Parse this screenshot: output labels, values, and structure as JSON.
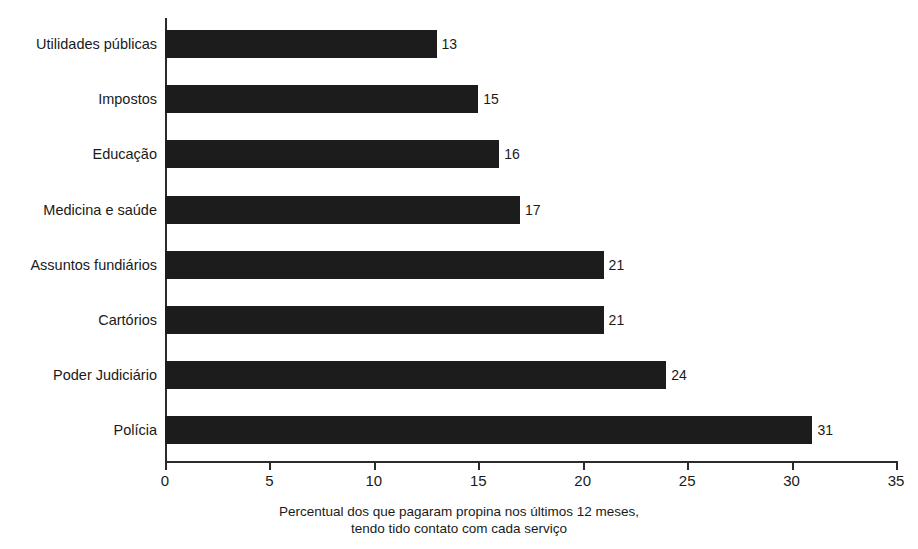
{
  "chart_data": {
    "type": "bar",
    "orientation": "horizontal",
    "title": "",
    "subtitle": "",
    "xlabel": "Percentual dos que pagaram propina nos últimos 12 meses, tendo tido contato com cada serviço",
    "ylabel": "",
    "xlim": [
      0,
      35
    ],
    "xticks": [
      0,
      5,
      10,
      15,
      20,
      25,
      30,
      35
    ],
    "xtick_labels": [
      "0",
      "5",
      "10",
      "15",
      "20",
      "25",
      "30",
      "35"
    ],
    "grid": false,
    "legend": null,
    "bar_color": "#1c1c1c",
    "categories": [
      "Utilidades públicas",
      "Impostos",
      "Educação",
      "Medicina e saúde",
      "Assuntos fundiários",
      "Cartórios",
      "Poder Judiciário",
      "Polícia"
    ],
    "values": [
      13,
      15,
      16,
      17,
      21,
      21,
      24,
      31
    ],
    "data_labels": [
      "13",
      "15",
      "16",
      "17",
      "21",
      "21",
      "24",
      "31"
    ]
  },
  "caption": {
    "line1": "Percentual dos que pagaram propina nos últimos 12 meses,",
    "line2": "tendo tido contato com cada serviço"
  },
  "axis": {
    "x_tick_labels": [
      "0",
      "5",
      "10",
      "15",
      "20",
      "25",
      "30",
      "35"
    ]
  }
}
